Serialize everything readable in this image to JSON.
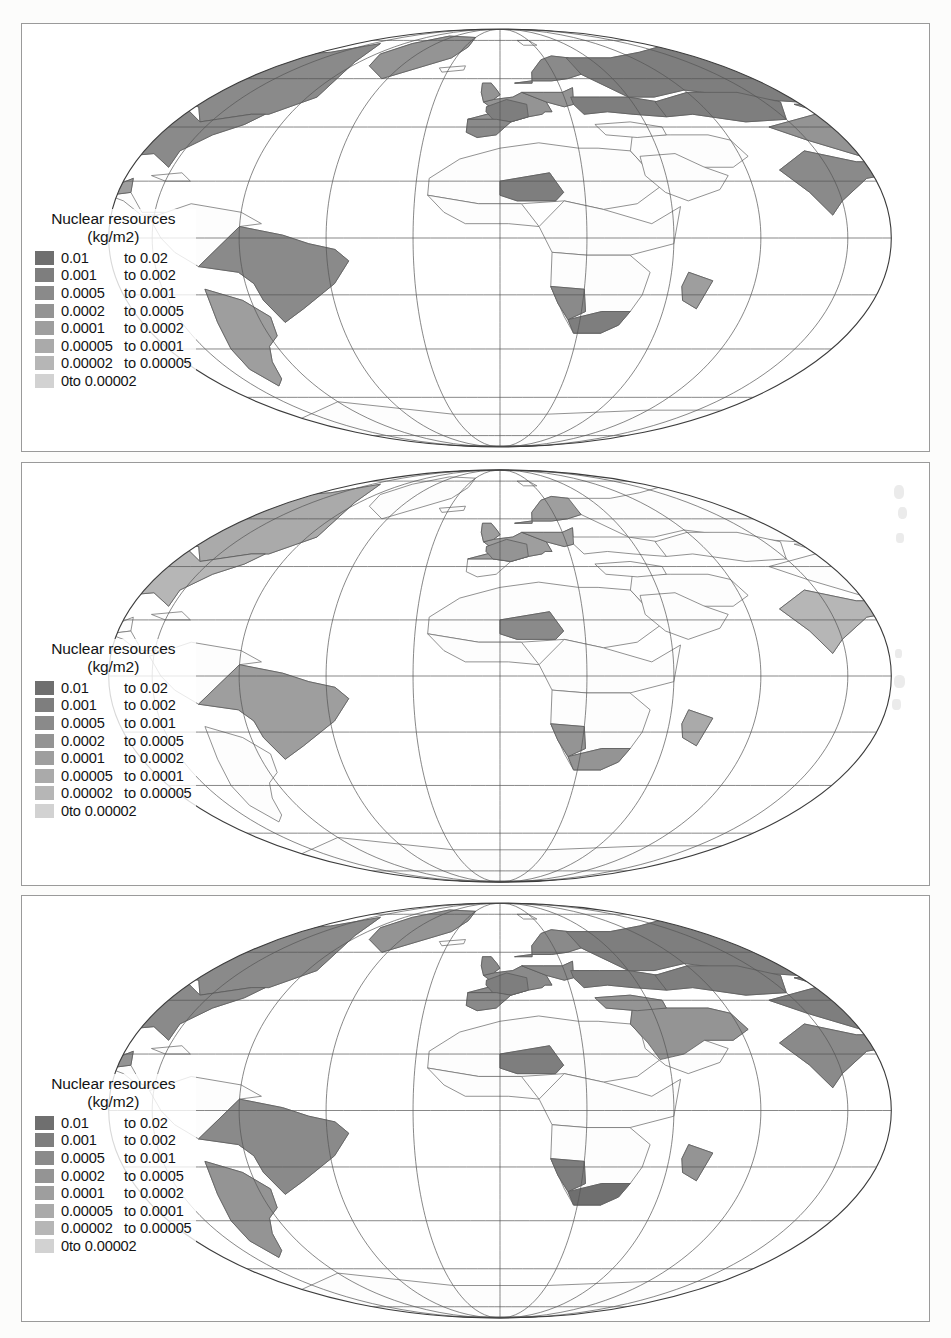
{
  "document": {
    "kind": "figure-sheet",
    "panel_count": 3,
    "background": "#fcfcfb"
  },
  "legend": {
    "title_line1": "Nuclear resources",
    "title_line2": "(kg/m2)",
    "connector": "to",
    "classes": [
      {
        "low": "0.01",
        "high": "0.02",
        "color": "#6f6f6f"
      },
      {
        "low": "0.001",
        "high": "0.002",
        "color": "#7e7e7e"
      },
      {
        "low": "0.0005",
        "high": "0.001",
        "color": "#8a8a8a"
      },
      {
        "low": "0.0002",
        "high": "0.0005",
        "color": "#949494"
      },
      {
        "low": "0.0001",
        "high": "0.0002",
        "color": "#9e9e9e"
      },
      {
        "low": "0.00005",
        "high": "0.0001",
        "color": "#aaaaaa"
      },
      {
        "low": "0.00002",
        "high": "0.00005",
        "color": "#b6b6b6"
      },
      {
        "low": "0",
        "high": "0.00002",
        "color": "#d2d2d2",
        "single": true
      }
    ]
  },
  "chart_data": {
    "type": "map",
    "title": "Nuclear resources (kg/m2)",
    "projection": "mollweide",
    "map_count": 3,
    "graticule": {
      "lon_step_deg": 20,
      "lat_step_deg": 20,
      "grid": true
    },
    "units": "kg/m2",
    "value_range": [
      0,
      0.02
    ],
    "class_breaks": [
      0,
      2e-05,
      5e-05,
      0.0001,
      0.0002,
      0.0005,
      0.001,
      0.002,
      0.01,
      0.02
    ],
    "class_colors": [
      "#d2d2d2",
      "#b6b6b6",
      "#aaaaaa",
      "#9e9e9e",
      "#949494",
      "#8a8a8a",
      "#7e7e7e",
      "#6f6f6f"
    ],
    "panels": [
      {
        "index": 1,
        "name": "panel-top",
        "regions": [
          {
            "name": "canada",
            "class": 5
          },
          {
            "name": "united-states",
            "class": 5
          },
          {
            "name": "greenland",
            "class": 4
          },
          {
            "name": "mexico",
            "class": 3
          },
          {
            "name": "brazil",
            "class": 5
          },
          {
            "name": "south-america-south",
            "class": 3
          },
          {
            "name": "western-europe",
            "class": 4
          },
          {
            "name": "france",
            "class": 6
          },
          {
            "name": "spain",
            "class": 5
          },
          {
            "name": "scandinavia",
            "class": 5
          },
          {
            "name": "ukraine-russia-west",
            "class": 6
          },
          {
            "name": "russia",
            "class": 6
          },
          {
            "name": "kazakhstan",
            "class": 6
          },
          {
            "name": "china",
            "class": 4
          },
          {
            "name": "india",
            "class": 5
          },
          {
            "name": "niger",
            "class": 6
          },
          {
            "name": "namibia",
            "class": 5
          },
          {
            "name": "south-africa",
            "class": 6
          },
          {
            "name": "madagascar",
            "class": 3
          },
          {
            "name": "australia",
            "class": 5
          },
          {
            "name": "indonesia",
            "class": 3
          },
          {
            "name": "japan",
            "class": 4
          }
        ]
      },
      {
        "index": 2,
        "name": "panel-middle",
        "regions": [
          {
            "name": "canada",
            "class": 2
          },
          {
            "name": "united-states",
            "class": 1
          },
          {
            "name": "brazil",
            "class": 3
          },
          {
            "name": "western-europe",
            "class": 3
          },
          {
            "name": "france",
            "class": 4
          },
          {
            "name": "scandinavia",
            "class": 3
          },
          {
            "name": "niger",
            "class": 5
          },
          {
            "name": "namibia",
            "class": 4
          },
          {
            "name": "south-africa",
            "class": 4
          },
          {
            "name": "madagascar",
            "class": 2
          },
          {
            "name": "australia",
            "class": 4
          },
          {
            "name": "indonesia",
            "class": 2
          },
          {
            "name": "india",
            "class": 1
          }
        ]
      },
      {
        "index": 3,
        "name": "panel-bottom",
        "regions": [
          {
            "name": "canada",
            "class": 5
          },
          {
            "name": "united-states",
            "class": 5
          },
          {
            "name": "greenland",
            "class": 4
          },
          {
            "name": "mexico",
            "class": 4
          },
          {
            "name": "brazil",
            "class": 5
          },
          {
            "name": "south-america-south",
            "class": 4
          },
          {
            "name": "western-europe",
            "class": 5
          },
          {
            "name": "france",
            "class": 6
          },
          {
            "name": "spain",
            "class": 5
          },
          {
            "name": "scandinavia",
            "class": 5
          },
          {
            "name": "ukraine-russia-west",
            "class": 6
          },
          {
            "name": "russia",
            "class": 6
          },
          {
            "name": "kazakhstan",
            "class": 6
          },
          {
            "name": "china",
            "class": 6
          },
          {
            "name": "india",
            "class": 5
          },
          {
            "name": "niger",
            "class": 6
          },
          {
            "name": "namibia",
            "class": 6
          },
          {
            "name": "south-africa",
            "class": 7
          },
          {
            "name": "madagascar",
            "class": 4
          },
          {
            "name": "australia",
            "class": 5
          },
          {
            "name": "indonesia",
            "class": 4
          },
          {
            "name": "japan",
            "class": 5
          },
          {
            "name": "middle-east",
            "class": 4
          }
        ]
      }
    ]
  }
}
